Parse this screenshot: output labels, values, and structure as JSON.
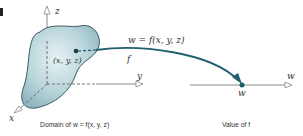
{
  "figure": {
    "marker": "▮",
    "axes": {
      "z_label": "z",
      "y_label": "y",
      "x_label": "x",
      "w_label": "w"
    },
    "point_label": "(x, y, z)",
    "arrow_label": "w = f(x, y, z)",
    "function_label": "f",
    "value_point_label": "w",
    "domain_caption": "Domain of w = f(x, y, z)",
    "value_caption": "Value of f",
    "colors": {
      "blob_fill": "#a9c9cf",
      "blob_edge": "#3c5b62",
      "arrow": "#1e5f6b",
      "axis": "#9a9a9a"
    }
  }
}
